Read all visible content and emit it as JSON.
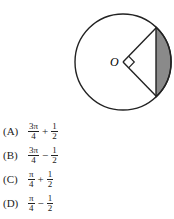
{
  "figure": {
    "center_label": "O",
    "circle": {
      "cx": 123,
      "cy": 62,
      "r": 48
    },
    "shaded_color": "#8a8a8a",
    "stroke_color": "#222222"
  },
  "choices": [
    {
      "letter": "(A)",
      "term1_num": "3π",
      "term1_den": "4",
      "op": "+",
      "term2_num": "1",
      "term2_den": "2"
    },
    {
      "letter": "(B)",
      "term1_num": "3π",
      "term1_den": "4",
      "op": "−",
      "term2_num": "1",
      "term2_den": "2"
    },
    {
      "letter": "(C)",
      "term1_num": "π",
      "term1_den": "4",
      "op": "+",
      "term2_num": "1",
      "term2_den": "2"
    },
    {
      "letter": "(D)",
      "term1_num": "π",
      "term1_den": "4",
      "op": "−",
      "term2_num": "1",
      "term2_den": "2"
    }
  ]
}
